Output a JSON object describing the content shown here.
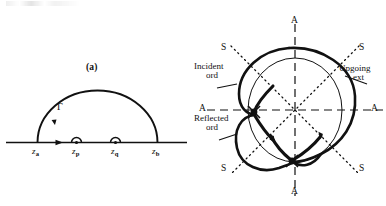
{
  "figure": {
    "panels": [
      {
        "id": "a",
        "caption": "(a)",
        "type": "complex-contour",
        "contour_label": "Γ",
        "real_axis_points": [
          {
            "name": "z_a",
            "base": "z",
            "sub": "a",
            "kind": "endpoint"
          },
          {
            "name": "z_p",
            "base": "z",
            "sub": "p",
            "kind": "pole"
          },
          {
            "name": "z_q",
            "base": "z",
            "sub": "q",
            "kind": "pole"
          },
          {
            "name": "z_b",
            "base": "z",
            "sub": "b",
            "kind": "endpoint"
          }
        ]
      },
      {
        "id": "b",
        "caption": "(b)",
        "type": "refractive-index-surface",
        "axis_labels": {
          "vertical_top": "A",
          "vertical_bottom": "A",
          "horizontal_left": "A",
          "horizontal_right": "A",
          "diagonal_upper_left": "S",
          "diagonal_upper_right": "S",
          "diagonal_lower_left": "S",
          "diagonal_lower_right": "S"
        },
        "annotations": [
          {
            "name": "incident-ord",
            "line1": "Incident",
            "line2": "ord"
          },
          {
            "name": "reflected-ord",
            "line1": "Reflected",
            "line2": "ord"
          },
          {
            "name": "upgoing-ext",
            "line1": "Upgoing",
            "line2": "ext"
          }
        ]
      }
    ]
  },
  "colors": {
    "ink": "#111111",
    "background": "#ffffff"
  }
}
